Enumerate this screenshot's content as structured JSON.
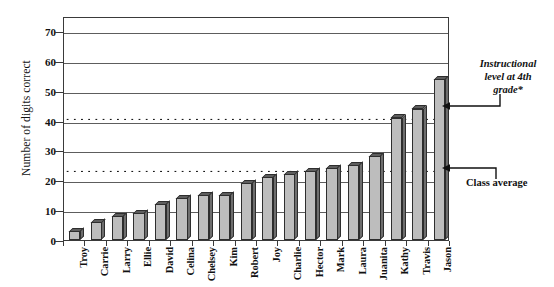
{
  "chart_data": {
    "type": "bar",
    "title": "",
    "xlabel": "",
    "ylabel": "Number of digits correct",
    "ylim": [
      0,
      75
    ],
    "yticks": [
      0,
      10,
      20,
      30,
      40,
      50,
      60,
      70
    ],
    "ytick_labels": [
      "0",
      "10",
      "20",
      "30",
      "40",
      "50",
      "60",
      "70"
    ],
    "grid": true,
    "legend": "none",
    "categories": [
      "Troy",
      "Carrie",
      "Larry",
      "Ellie",
      "David",
      "Celina",
      "Chelsey",
      "Kim",
      "Robert",
      "Joy",
      "Charlie",
      "Hector",
      "Mark",
      "Laura",
      "Juanita",
      "Kathy",
      "Travis",
      "Jason"
    ],
    "values": [
      3,
      6,
      8,
      9,
      12,
      14,
      15,
      15,
      19,
      21,
      22,
      23,
      24,
      25,
      28,
      41,
      44,
      54
    ],
    "reference_lines": [
      {
        "name": "instructional-level-line",
        "value": 41,
        "style": "dotted"
      },
      {
        "name": "class-average-line",
        "value": 23.5,
        "style": "dotted"
      }
    ],
    "annotations": [
      {
        "name": "instructional-level-annotation",
        "lines": [
          "Instructional",
          "level at 4th",
          "grade*"
        ],
        "points_to": 41
      },
      {
        "name": "class-average-annotation",
        "lines": [
          "Class average"
        ],
        "points_to": 23.5
      }
    ],
    "colors": {
      "bar_face": "#bdbdbd",
      "bar_top": "#5e5e5e",
      "bar_side": "#6e6e6e",
      "bar_edge": "#2e2e2e",
      "gridline": "#5d5d5d",
      "reference_line": "#000000",
      "text": "#111111",
      "background": "#ffffff"
    }
  },
  "axis": {
    "y_title": "Number of digits correct"
  },
  "annotations": {
    "instructional_line_1": "Instructional",
    "instructional_line_2": "level at 4th",
    "instructional_line_3": "grade*",
    "class_average": "Class average"
  }
}
